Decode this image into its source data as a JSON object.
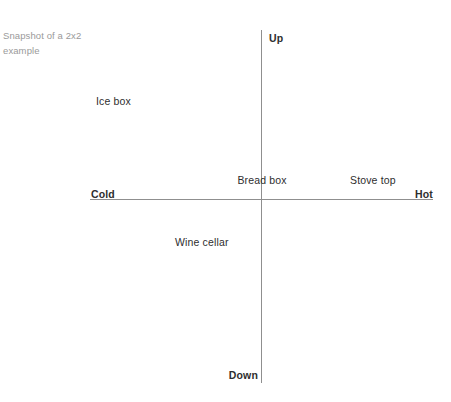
{
  "canvas": {
    "width": 451,
    "height": 402,
    "background": "#ffffff"
  },
  "caption": {
    "text": "Snapshot of a 2x2 example",
    "color": "#9a9a9a"
  },
  "chart_data": {
    "type": "scatter",
    "title": "Snapshot of a 2x2 example",
    "xlabel": "",
    "ylabel": "",
    "grid": false,
    "legend": "none",
    "axis_color": "#8f8f8f",
    "label_color": "#2e2e2e",
    "xlim": [
      -1,
      1
    ],
    "ylim": [
      -1,
      1
    ],
    "axes": {
      "horizontal": {
        "left_pole": "Cold",
        "right_pole": "Hot"
      },
      "vertical": {
        "top_pole": "Up",
        "bottom_pole": "Down"
      }
    },
    "points": [
      {
        "label": "Ice box",
        "quadrant": "upper-left",
        "x": -0.48,
        "y": 0.57
      },
      {
        "label": "Bread box",
        "quadrant": "center",
        "x": 0.0,
        "y": 0.13
      },
      {
        "label": "Stove top",
        "quadrant": "upper-right",
        "x": 0.57,
        "y": 0.13
      },
      {
        "label": "Wine cellar",
        "quadrant": "lower-left",
        "x": -0.24,
        "y": -0.2
      }
    ]
  }
}
